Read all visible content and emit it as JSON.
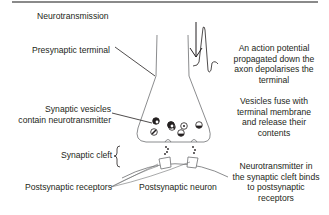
{
  "title": "Neurotransmission",
  "labels": {
    "presynaptic_terminal": "Presynaptic terminal",
    "synaptic_vesicles": [
      "Synaptic vesicles",
      "contain neurotransmitter"
    ],
    "synaptic_cleft": "Synaptic cleft",
    "postsynaptic_receptors": "Postsynaptic receptors",
    "postsynaptic_neuron": "Postsynaptic neuron"
  },
  "annotations": {
    "action_potential": [
      "An action potential",
      "propagated down the",
      "axon depolarises the",
      "terminal"
    ],
    "vesicle_fusion": [
      "Vesicles fuse with",
      "terminal membrane",
      "and release their",
      "contents"
    ],
    "binding": [
      "Neurotransmitter in",
      "the synaptic cleft binds",
      "to postsynaptic",
      "receptors"
    ]
  },
  "colors": {
    "line": "#231f20",
    "outline": "#6d6e71",
    "topbar": "#8a8a8a"
  }
}
